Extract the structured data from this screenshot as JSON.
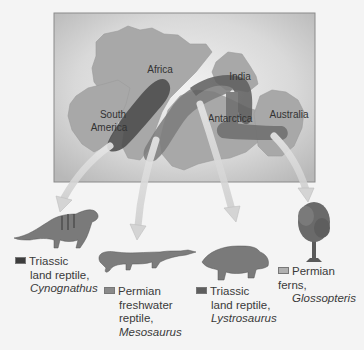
{
  "map": {
    "continents": [
      {
        "name": "Africa"
      },
      {
        "name": "South America"
      },
      {
        "name": "India"
      },
      {
        "name": "Antarctica"
      },
      {
        "name": "Australia"
      }
    ],
    "labels": {
      "africa": "Africa",
      "south_america_line1": "South",
      "south_america_line2": "America",
      "india": "India",
      "antarctica": "Antarctica",
      "australia": "Australia"
    }
  },
  "legend": [
    {
      "period": "Triassic",
      "line2": "land reptile,",
      "scientific": "Cynognathus",
      "swatch_color": "#3c3c3c",
      "figure": "cynognathus-illustration"
    },
    {
      "period": "Permian",
      "line2": "freshwater",
      "line3": "reptile,",
      "scientific": "Mesosaurus",
      "swatch_color": "#8a8a8a",
      "figure": "mesosaurus-illustration"
    },
    {
      "period": "Triassic",
      "line2": "land reptile,",
      "scientific": "Lystrosaurus",
      "swatch_color": "#5e5e5e",
      "figure": "lystrosaurus-illustration"
    },
    {
      "period": "Permian ferns,",
      "scientific": "Glossopteris",
      "swatch_color": "#b0b0b0",
      "figure": "glossopteris-illustration"
    }
  ],
  "colors": {
    "map_bg": "#c9c9c9",
    "land": "#a9a9a9",
    "arrow": "#d8d8d8"
  }
}
